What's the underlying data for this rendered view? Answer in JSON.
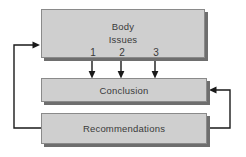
{
  "diagram": {
    "background_color": "#ffffff",
    "box_fill_color": "#cfcfcf",
    "box_border_color": "#8a8a8a",
    "box_shadow_color": "#6e6e6e",
    "line_color": "#1a1a1a",
    "text_color": "#3a3a3a"
  },
  "nodes": {
    "body": {
      "line1": "Body",
      "line2": "Issues",
      "issues": [
        "1",
        "2",
        "3"
      ]
    },
    "conclusion": {
      "label": "Conclusion"
    },
    "recommendations": {
      "label": "Recommendations"
    }
  },
  "connectors": [
    {
      "name": "issue-1-to-conclusion",
      "from": "body",
      "to": "conclusion",
      "arrow": "down"
    },
    {
      "name": "issue-2-to-conclusion",
      "from": "body",
      "to": "conclusion",
      "arrow": "down"
    },
    {
      "name": "issue-3-to-conclusion",
      "from": "body",
      "to": "conclusion",
      "arrow": "down"
    },
    {
      "name": "recommendations-to-conclusion",
      "from": "recommendations",
      "to": "conclusion",
      "arrow": "left"
    },
    {
      "name": "recommendations-to-body",
      "from": "recommendations",
      "to": "body",
      "arrow": "right"
    }
  ]
}
